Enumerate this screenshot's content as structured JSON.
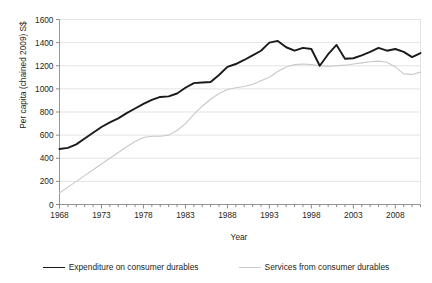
{
  "chart_data": {
    "type": "line",
    "title": "",
    "xlabel": "Year",
    "ylabel": "Per capita (chained 2009) S$",
    "xlim": [
      1968,
      2011
    ],
    "ylim": [
      0,
      1600
    ],
    "ytick_step": 200,
    "yticks": [
      0,
      200,
      400,
      600,
      800,
      1000,
      1200,
      1400,
      1600
    ],
    "xticks_labeled": [
      1968,
      1973,
      1978,
      1983,
      1988,
      1993,
      1998,
      2003,
      2008
    ],
    "xtick_minor_step": 1,
    "grid": "horizontal",
    "legend_position": "bottom",
    "x": [
      1968,
      1969,
      1970,
      1971,
      1972,
      1973,
      1974,
      1975,
      1976,
      1977,
      1978,
      1979,
      1980,
      1981,
      1982,
      1983,
      1984,
      1985,
      1986,
      1987,
      1988,
      1989,
      1990,
      1991,
      1992,
      1993,
      1994,
      1995,
      1996,
      1997,
      1998,
      1999,
      2000,
      2001,
      2002,
      2003,
      2004,
      2005,
      2006,
      2007,
      2008,
      2009,
      2010,
      2011
    ],
    "series": [
      {
        "name": "Expenditure on consumer durables",
        "color": "#1a1a1a",
        "width": 1.9,
        "values": [
          480,
          490,
          520,
          570,
          620,
          670,
          710,
          745,
          790,
          830,
          870,
          905,
          930,
          935,
          960,
          1010,
          1050,
          1055,
          1060,
          1120,
          1190,
          1215,
          1250,
          1290,
          1330,
          1400,
          1415,
          1360,
          1330,
          1355,
          1345,
          1200,
          1300,
          1380,
          1260,
          1265,
          1290,
          1320,
          1355,
          1330,
          1345,
          1320,
          1275,
          1310
        ]
      },
      {
        "name": "Services from consumer durables",
        "color": "#c9c9c9",
        "width": 1.1,
        "values": [
          100,
          150,
          200,
          250,
          300,
          350,
          400,
          450,
          500,
          545,
          580,
          590,
          590,
          600,
          640,
          700,
          780,
          850,
          910,
          960,
          995,
          1010,
          1020,
          1040,
          1070,
          1100,
          1150,
          1190,
          1210,
          1215,
          1210,
          1200,
          1195,
          1200,
          1205,
          1215,
          1225,
          1235,
          1240,
          1230,
          1190,
          1130,
          1125,
          1145
        ]
      }
    ]
  },
  "legend": {
    "items": [
      {
        "label": "Expenditure on consumer durables",
        "swatch": "expenditure"
      },
      {
        "label": "Services from consumer durables",
        "swatch": "services"
      }
    ]
  },
  "axes": {
    "y_title": "Per capita (chained 2009) S$",
    "x_title": "Year"
  },
  "title_clipped": ""
}
